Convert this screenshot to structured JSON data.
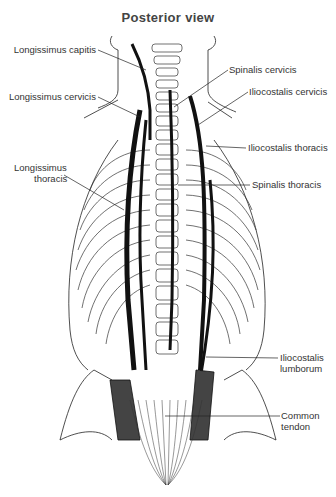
{
  "title": "Posterior view",
  "labels": {
    "longissimus_capitis": "Longissimus capitis",
    "longissimus_cervicis": "Longissimus cervicis",
    "longissimus_thoracis_1": "Longissimus",
    "longissimus_thoracis_2": "thoracis",
    "spinalis_cervicis": "Spinalis cervicis",
    "iliocostalis_cervicis": "Iliocostalis cervicis",
    "iliocostalis_thoracis": "Iliocostalis thoracis",
    "spinalis_thoracis": "Spinalis thoracis",
    "iliocostalis_lumborum_1": "Iliocostalis",
    "iliocostalis_lumborum_2": "lumborum",
    "common_tendon_1": "Common",
    "common_tendon_2": "tendon"
  }
}
